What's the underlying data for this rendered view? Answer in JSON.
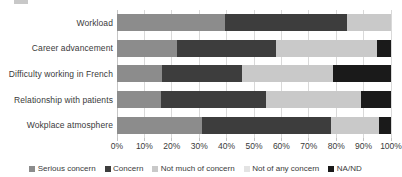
{
  "chart_data": {
    "type": "bar",
    "orientation": "horizontal",
    "stacked": true,
    "stack_mode": "percent",
    "title": "",
    "xlabel": "",
    "ylabel": "",
    "xlim": [
      0,
      100
    ],
    "grid": true,
    "legend_position": "bottom",
    "categories": [
      "Workload",
      "Career advancement",
      "Difficulty working in French",
      "Relationship with patients",
      "Wokplace atmosphere"
    ],
    "xticks": [
      "0%",
      "10%",
      "20%",
      "30%",
      "40%",
      "50%",
      "60%",
      "70%",
      "80%",
      "90%",
      "100%"
    ],
    "xtick_values": [
      0,
      10,
      20,
      30,
      40,
      50,
      60,
      70,
      80,
      90,
      100
    ],
    "series": [
      {
        "name": "Serious concern",
        "color": "#8c8c8c",
        "values": [
          39.5,
          22.0,
          16.5,
          16.0,
          31.0
        ]
      },
      {
        "name": "Concern",
        "color": "#3d3d3d",
        "values": [
          44.5,
          36.0,
          29.0,
          38.5,
          47.0
        ]
      },
      {
        "name": "Not much of concern",
        "color": "#c9c9c9",
        "values": [
          16.0,
          37.0,
          33.5,
          34.5,
          17.5
        ]
      },
      {
        "name": "Not of any concern",
        "color": "#e3e3e3",
        "values": [
          0.0,
          0.0,
          0.0,
          0.0,
          0.0
        ]
      },
      {
        "name": "NA/ND",
        "color": "#1a1a1a",
        "values": [
          0.0,
          5.0,
          21.0,
          11.0,
          4.5
        ]
      }
    ]
  },
  "legend": {
    "items": [
      {
        "label": "Serious concern",
        "color": "#8c8c8c"
      },
      {
        "label": "Concern",
        "color": "#3d3d3d"
      },
      {
        "label": "Not much of concern",
        "color": "#c9c9c9"
      },
      {
        "label": "Not of any concern",
        "color": "#e3e3e3"
      },
      {
        "label": "NA/ND",
        "color": "#1a1a1a"
      }
    ]
  }
}
